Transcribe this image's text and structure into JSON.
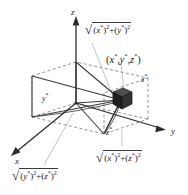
{
  "figure": {
    "type": "3d-coordinate-diagram",
    "background_color": "#ffffff",
    "line_color": "#3a3a3a",
    "dashed_color": "#6b6b6b",
    "leader_color": "#b9b9b9",
    "marker_color": "#2b2b2b"
  },
  "axes": {
    "x": {
      "label": "x",
      "direction": "lower-left"
    },
    "y": {
      "label": "y",
      "direction": "right"
    },
    "z": {
      "label": "z",
      "direction": "up"
    }
  },
  "point": {
    "label_open": "(",
    "x": "x",
    "y": "y",
    "z": "z",
    "star": "*",
    "sep": ",",
    "label_close": ")"
  },
  "inner_labels": {
    "x_star": "x",
    "y_star": "y",
    "z_star": "z",
    "star": "*"
  },
  "distance_labels": {
    "top": {
      "name": "distance-xy",
      "radical": "√",
      "first_var": "x",
      "second_var": "y",
      "star": "*",
      "power": "2",
      "plus": "+",
      "open": "(",
      "close": ")"
    },
    "bottom_right": {
      "name": "distance-xz",
      "radical": "√",
      "first_var": "x",
      "second_var": "z",
      "star": "*",
      "power": "2",
      "plus": "+",
      "open": "(",
      "close": ")"
    },
    "bottom_left": {
      "name": "distance-yz",
      "radical": "√",
      "first_var": "y",
      "second_var": "z",
      "star": "*",
      "power": "2",
      "plus": "+",
      "open": "(",
      "close": ")"
    }
  }
}
